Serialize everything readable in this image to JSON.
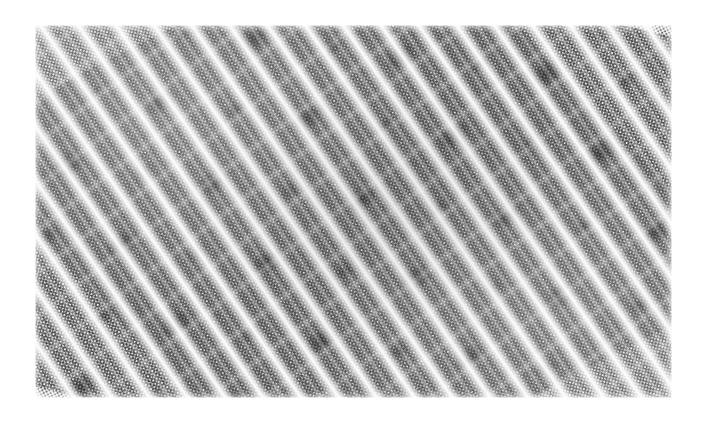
{
  "image": {
    "kind": "halftone-moire-texture",
    "description": "Scanned grayscale halftone print showing a diagonal moire interference pattern",
    "canvas": {
      "width": 707,
      "height": 428,
      "background_color": "#ffffff"
    },
    "plate": {
      "left": 35,
      "top": 25,
      "width": 637,
      "height": 373,
      "border": "none"
    },
    "pattern": {
      "halftone_dot_pitch_px": 3,
      "screen_angles_deg": [
        14,
        -27,
        47
      ],
      "moire_stripe_angle_deg": -35,
      "moire_stripe_period_px": 31,
      "secondary_stripe_period_px": 15.5,
      "rosette_spacing_px": [
        112,
        96
      ],
      "tone_min_hex": "#ffffff",
      "tone_mid_hex": "#9a9a9a",
      "tone_max_hex": "#2e2e2e"
    }
  }
}
